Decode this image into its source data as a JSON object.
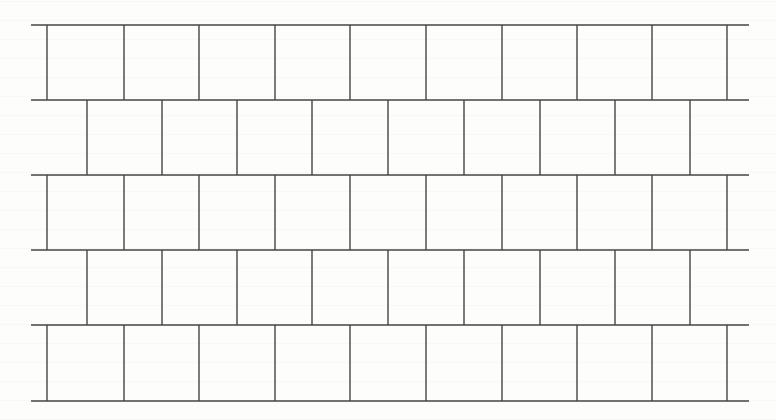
{
  "figure": {
    "line_color": "#444444",
    "background_color": "#fdfdfc",
    "line_width": 1.4,
    "left": 31,
    "right": 749,
    "row_y": [
      25,
      100,
      175,
      250,
      325,
      401
    ],
    "rows": [
      {
        "verticals": [
          47,
          124,
          199,
          275,
          350,
          426,
          502,
          577,
          652,
          727
        ]
      },
      {
        "verticals": [
          87,
          162,
          237,
          312,
          388,
          464,
          540,
          615,
          690
        ]
      },
      {
        "verticals": [
          47,
          124,
          199,
          275,
          350,
          426,
          502,
          577,
          652,
          727
        ]
      },
      {
        "verticals": [
          87,
          162,
          237,
          312,
          388,
          464,
          540,
          615,
          690
        ]
      },
      {
        "verticals": [
          47,
          124,
          199,
          275,
          350,
          426,
          502,
          577,
          652,
          727
        ]
      }
    ]
  }
}
